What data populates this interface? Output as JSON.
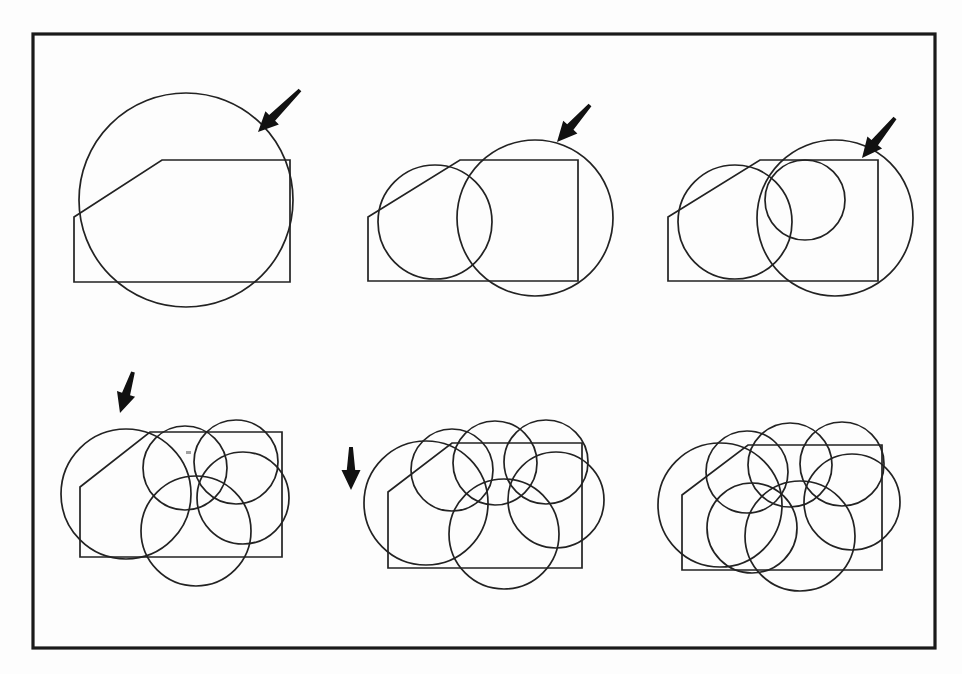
{
  "figure": {
    "title": "Progressive disk covering of a chamfered polygon",
    "background_color": "#fdfdfd",
    "ink_color": "#222222",
    "frame_color": "#1a1a1a",
    "arrow_color": "#111111",
    "panel_count": 6,
    "arrow_count": 5,
    "frame": {
      "x": 33,
      "y": 34,
      "width": 902,
      "height": 614
    }
  },
  "chart_data": {
    "type": "diagram",
    "title": "Progressive disk covering of a chamfered polygon",
    "polygon_vertices_panel1": [
      [
        74,
        217
      ],
      [
        162,
        160
      ],
      [
        290,
        160
      ],
      [
        290,
        282
      ],
      [
        74,
        282
      ]
    ],
    "panels": [
      {
        "index": 1,
        "label": "panel-1",
        "circle_count": 1,
        "arrow": true,
        "polygon": [
          [
            74,
            217
          ],
          [
            162,
            160
          ],
          [
            290,
            160
          ],
          [
            290,
            282
          ],
          [
            74,
            282
          ]
        ],
        "circles": [
          {
            "cx": 186,
            "cy": 200,
            "r": 107
          }
        ]
      },
      {
        "index": 2,
        "label": "panel-2",
        "circle_count": 2,
        "arrow": true,
        "polygon": [
          [
            368,
            217
          ],
          [
            460,
            160
          ],
          [
            578,
            160
          ],
          [
            578,
            281
          ],
          [
            368,
            281
          ]
        ],
        "circles": [
          {
            "cx": 435,
            "cy": 222,
            "r": 57
          },
          {
            "cx": 535,
            "cy": 218,
            "r": 78
          }
        ]
      },
      {
        "index": 3,
        "label": "panel-3",
        "circle_count": 3,
        "arrow": true,
        "polygon": [
          [
            668,
            217
          ],
          [
            760,
            160
          ],
          [
            878,
            160
          ],
          [
            878,
            281
          ],
          [
            668,
            281
          ]
        ],
        "circles": [
          {
            "cx": 735,
            "cy": 222,
            "r": 57
          },
          {
            "cx": 835,
            "cy": 218,
            "r": 78
          },
          {
            "cx": 805,
            "cy": 200,
            "r": 40
          }
        ]
      },
      {
        "index": 4,
        "label": "panel-4",
        "circle_count": 5,
        "arrow": true,
        "polygon": [
          [
            80,
            487
          ],
          [
            150,
            432
          ],
          [
            282,
            432
          ],
          [
            282,
            557
          ],
          [
            80,
            557
          ]
        ],
        "circles": [
          {
            "cx": 126,
            "cy": 494,
            "r": 65
          },
          {
            "cx": 185,
            "cy": 468,
            "r": 42
          },
          {
            "cx": 236,
            "cy": 462,
            "r": 42
          },
          {
            "cx": 243,
            "cy": 498,
            "r": 46
          },
          {
            "cx": 196,
            "cy": 531,
            "r": 55
          }
        ]
      },
      {
        "index": 5,
        "label": "panel-5",
        "circle_count": 6,
        "arrow": true,
        "polygon": [
          [
            388,
            492
          ],
          [
            452,
            443
          ],
          [
            582,
            443
          ],
          [
            582,
            568
          ],
          [
            388,
            568
          ]
        ],
        "circles": [
          {
            "cx": 426,
            "cy": 503,
            "r": 62
          },
          {
            "cx": 452,
            "cy": 470,
            "r": 41
          },
          {
            "cx": 495,
            "cy": 463,
            "r": 42
          },
          {
            "cx": 546,
            "cy": 462,
            "r": 42
          },
          {
            "cx": 556,
            "cy": 500,
            "r": 48
          },
          {
            "cx": 504,
            "cy": 534,
            "r": 55
          }
        ]
      },
      {
        "index": 6,
        "label": "panel-6",
        "circle_count": 7,
        "arrow": false,
        "polygon": [
          [
            682,
            495
          ],
          [
            748,
            445
          ],
          [
            882,
            445
          ],
          [
            882,
            570
          ],
          [
            682,
            570
          ]
        ],
        "circles": [
          {
            "cx": 720,
            "cy": 505,
            "r": 62
          },
          {
            "cx": 747,
            "cy": 472,
            "r": 41
          },
          {
            "cx": 790,
            "cy": 465,
            "r": 42
          },
          {
            "cx": 842,
            "cy": 464,
            "r": 42
          },
          {
            "cx": 852,
            "cy": 502,
            "r": 48
          },
          {
            "cx": 800,
            "cy": 536,
            "r": 55
          },
          {
            "cx": 752,
            "cy": 528,
            "r": 45
          }
        ]
      }
    ],
    "arrows": [
      {
        "panel": 1,
        "name": "arrow-panel-1",
        "tail": [
          300,
          90
        ],
        "tip": [
          258,
          132
        ],
        "angle_deg": 225
      },
      {
        "panel": 2,
        "name": "arrow-panel-2",
        "tail": [
          590,
          105
        ],
        "tip": [
          557,
          142
        ],
        "angle_deg": 228
      },
      {
        "panel": 3,
        "name": "arrow-panel-3",
        "tail": [
          895,
          118
        ],
        "tip": [
          862,
          158
        ],
        "angle_deg": 230
      },
      {
        "panel": 4,
        "name": "arrow-panel-4",
        "tail": [
          133,
          372
        ],
        "tip": [
          120,
          413
        ],
        "angle_deg": 252
      },
      {
        "panel": 5,
        "name": "arrow-panel-5",
        "tail": [
          351,
          447
        ],
        "tip": [
          351,
          490
        ],
        "angle_deg": 270
      }
    ]
  }
}
